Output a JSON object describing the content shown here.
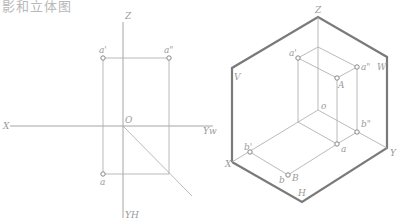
{
  "title": "影和立体图",
  "left_diagram": {
    "name": "projection-drawing",
    "labels": {
      "z": "Z",
      "a_prime": "a'",
      "a_double_prime": "a\"",
      "x": "X",
      "o": "O",
      "y_w": "Yw",
      "a": "a",
      "y_h": "YH"
    }
  },
  "right_diagram": {
    "name": "axonometric-drawing",
    "labels": {
      "z": "Z",
      "v": "V",
      "a_prime": "a'",
      "a_double_prime": "a\"",
      "w": "W",
      "A": "A",
      "o": "o",
      "b_double_prime": "b\"",
      "b_prime": "b'",
      "a": "a",
      "x": "X",
      "y": "Y",
      "b": "b",
      "B": "B",
      "h": "H"
    }
  },
  "colors": {
    "line": "#a8a8a8",
    "frame": "#7a7a7a",
    "text": "#9a9a9a"
  }
}
